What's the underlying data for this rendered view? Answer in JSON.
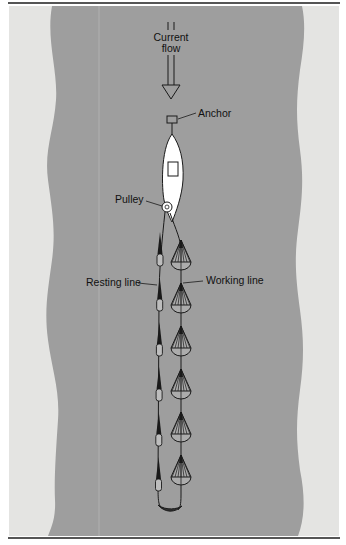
{
  "diagram": {
    "labels": {
      "current": "Current",
      "flow": "flow",
      "anchor": "Anchor",
      "pulley": "Pulley",
      "resting_line": "Resting line",
      "working_line": "Working line"
    },
    "colors": {
      "water": "#9e9e9e",
      "bank": "#e4e4e2",
      "boat": "#ffffff",
      "ink": "#1a1a1a"
    },
    "working_line_nets": 6,
    "resting_line_nets": 6
  }
}
